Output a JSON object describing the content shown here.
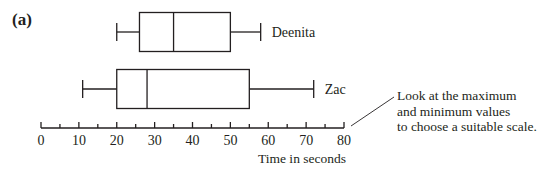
{
  "part_label": "(a)",
  "annotation": {
    "lines": [
      "Look at the maximum",
      "and minimum values",
      "to choose a suitable scale."
    ]
  },
  "chart_data": {
    "type": "boxplot",
    "title": "",
    "xlabel": "Time in seconds",
    "ylabel": "",
    "xlim": [
      0,
      80
    ],
    "x_ticks_major": [
      0,
      10,
      20,
      30,
      40,
      50,
      60,
      70,
      80
    ],
    "x_ticks_minor_step": 5,
    "grid": false,
    "series": [
      {
        "name": "Deenita",
        "min": 20,
        "q1": 26,
        "median": 35,
        "q3": 50,
        "max": 58
      },
      {
        "name": "Zac",
        "min": 11,
        "q1": 20,
        "median": 28,
        "q3": 55,
        "max": 72
      }
    ]
  },
  "colors": {
    "ink": "#231f20",
    "background": "#ffffff"
  }
}
